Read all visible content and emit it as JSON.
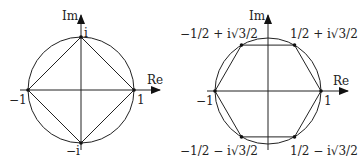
{
  "figures": [
    {
      "name": "square-roots-of-unity-4",
      "axes": {
        "x_label": "Re",
        "y_label": "Im"
      },
      "points": [
        {
          "label": "i",
          "value": "i"
        },
        {
          "label": "1",
          "value": "1"
        },
        {
          "label": "−1",
          "value": "-1"
        },
        {
          "label": "−i",
          "value": "-i"
        }
      ],
      "polygon": "square"
    },
    {
      "name": "roots-of-unity-6",
      "axes": {
        "x_label": "Re",
        "y_label": "Im"
      },
      "points": [
        {
          "label": "1",
          "value": "1"
        },
        {
          "label": "1/2 + i√3/2",
          "value": "1/2 + i sqrt(3)/2"
        },
        {
          "label": "−1/2 + i√3/2",
          "value": "-1/2 + i sqrt(3)/2"
        },
        {
          "label": "−1",
          "value": "-1"
        },
        {
          "label": "−1/2 − i√3/2",
          "value": "-1/2 - i sqrt(3)/2"
        },
        {
          "label": "1/2 − i√3/2",
          "value": "1/2 - i sqrt(3)/2"
        }
      ],
      "polygon": "hexagon"
    }
  ]
}
